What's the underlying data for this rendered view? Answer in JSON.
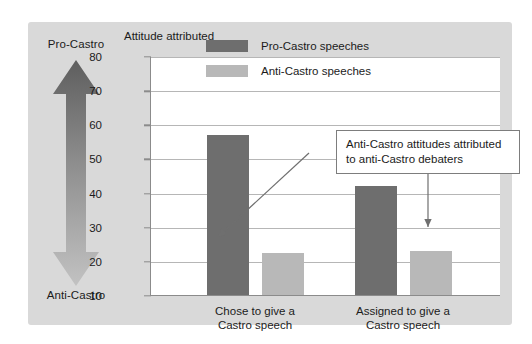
{
  "figure": {
    "axis_title": "Attitude attributed",
    "scale": {
      "top_label": "Pro-Castro",
      "bottom_label": "Anti-Castro",
      "arrow_icon": "double-headed-vertical-arrow"
    },
    "annotation": {
      "line1": "Anti-Castro attitudes attributed",
      "line2": "to anti-Castro debaters"
    },
    "colors": {
      "panel": "#d9d9d9",
      "plot": "#ffffff",
      "pro_castro_bar": "#6e6e6e",
      "anti_castro_bar": "#b8b8b8",
      "gridline": "#b6b6b6",
      "axis": "#8b8b8b",
      "text": "#1b1b1b"
    }
  },
  "chart_data": {
    "type": "bar",
    "title": "Attitude attributed",
    "xlabel": "",
    "ylabel": "Attitude attributed",
    "ylim": [
      10,
      80
    ],
    "yticks": [
      10,
      20,
      30,
      40,
      50,
      60,
      70,
      80
    ],
    "grid": true,
    "legend_position": "inside-top-left",
    "categories": [
      "Chose to give a Castro speech",
      "Assigned to give a Castro speech"
    ],
    "category_lines": [
      [
        "Chose to give a",
        "Castro speech"
      ],
      [
        "Assigned to give a",
        "Castro speech"
      ]
    ],
    "series": [
      {
        "name": "Pro-Castro speeches",
        "color": "#6e6e6e",
        "values": [
          57,
          42
        ]
      },
      {
        "name": "Anti-Castro speeches",
        "color": "#b8b8b8",
        "values": [
          22.3,
          23
        ]
      }
    ],
    "annotations": [
      {
        "text": "Anti-Castro attitudes attributed to anti-Castro debaters",
        "points_to": [
          "Chose to give a Castro speech / Anti-Castro speeches",
          "Assigned to give a Castro speech / Anti-Castro speeches"
        ]
      }
    ]
  }
}
